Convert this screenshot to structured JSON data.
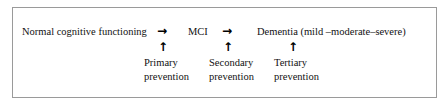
{
  "figure": {
    "stages": [
      {
        "id": "normal",
        "label": "Normal cognitive functioning"
      },
      {
        "id": "mci",
        "label": "MCI"
      },
      {
        "id": "dementia",
        "label": "Dementia (mild –moderate–severe)"
      }
    ],
    "transitions": [
      {
        "id": "normal-to-mci",
        "glyph": "→"
      },
      {
        "id": "mci-to-dementia",
        "glyph": "→"
      }
    ],
    "uplinks": [
      {
        "id": "uplink-primary",
        "glyph": "↑"
      },
      {
        "id": "uplink-secondary",
        "glyph": "↑"
      },
      {
        "id": "uplink-tertiary",
        "glyph": "↑"
      }
    ],
    "prevention_levels": [
      {
        "id": "primary",
        "line1": "Primary",
        "line2": "prevention"
      },
      {
        "id": "secondary",
        "line1": "Secondary",
        "line2": "prevention"
      },
      {
        "id": "tertiary",
        "line1": "Tertiary",
        "line2": "prevention"
      }
    ],
    "colors": {
      "border": "#9a9a9a",
      "text": "#111111",
      "background": "#ffffff"
    }
  }
}
